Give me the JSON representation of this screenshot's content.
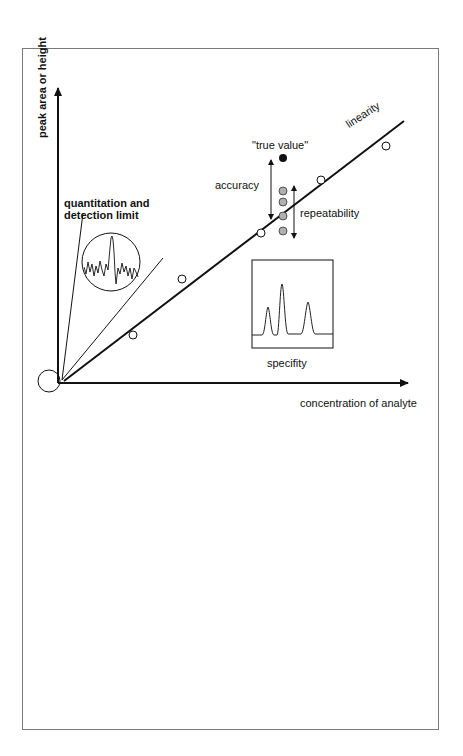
{
  "diagram": {
    "y_axis_label": "peak area or height",
    "x_axis_label": "concentration of analyte",
    "annotations": {
      "quantitation_line1": "quantitation and",
      "quantitation_line2": "detection limit",
      "true_value": "\"true value\"",
      "accuracy": "accuracy",
      "repeatability": "repeatability",
      "linearity": "linearity",
      "specificity": "specifity"
    },
    "calibration_points": [
      [
        133,
        335
      ],
      [
        182,
        279
      ],
      [
        261,
        233
      ],
      [
        321,
        180
      ],
      [
        386,
        146
      ]
    ],
    "replicate_points": [
      191,
      202,
      216,
      231
    ],
    "colors": {
      "line": "#111111",
      "replicate_fill": "#b0b0b0",
      "true_value_fill": "#111111",
      "frame": "#7a7a7a"
    }
  }
}
